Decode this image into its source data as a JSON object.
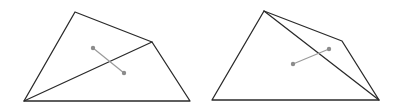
{
  "diagrams": [
    {
      "id": "left",
      "vertices": {
        "top": [
          75,
          12
        ],
        "right": [
          152,
          42
        ],
        "bottom_left": [
          24,
          101
        ],
        "bottom_right": [
          190,
          101
        ]
      },
      "outline": [
        [
          75,
          12
        ],
        [
          152,
          42
        ],
        [
          190,
          101
        ],
        [
          24,
          101
        ]
      ],
      "diagonal": [
        [
          24,
          101
        ],
        [
          152,
          42
        ]
      ],
      "segment": [
        [
          93,
          48
        ],
        [
          124,
          73
        ]
      ]
    },
    {
      "id": "right",
      "vertices": {
        "top": [
          264,
          11
        ],
        "right": [
          342,
          41
        ],
        "bottom_left": [
          212,
          100
        ],
        "bottom_right": [
          379,
          100
        ]
      },
      "outline": [
        [
          264,
          11
        ],
        [
          342,
          41
        ],
        [
          379,
          100
        ],
        [
          212,
          100
        ]
      ],
      "diagonal": [
        [
          264,
          11
        ],
        [
          379,
          100
        ]
      ],
      "segment": [
        [
          293,
          64
        ],
        [
          329,
          49
        ]
      ]
    }
  ],
  "colors": {
    "edge": "#2a2a2a",
    "segment": "#9a9a9a",
    "point": "#8c8c8c",
    "background": "#ffffff"
  }
}
